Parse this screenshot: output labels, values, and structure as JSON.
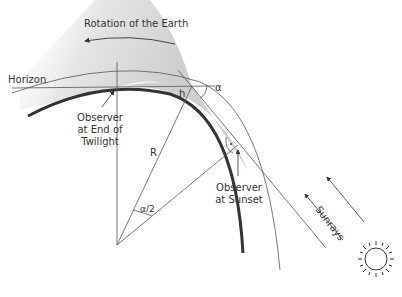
{
  "diagram": {
    "labels": {
      "rotation": "Rotation of the Earth",
      "horizon": "Horizon",
      "h": "h",
      "alpha": "α",
      "R": "R",
      "half_alpha": "α/2",
      "observer_twilight_1": "Observer",
      "observer_twilight_2": "at End of",
      "observer_twilight_3": "Twilight",
      "observer_sunset_1": "Observer",
      "observer_sunset_2": "at Sunset",
      "sunrays": "Sunrays"
    },
    "icons": {
      "sun": "sun-icon"
    },
    "colors": {
      "line": "#444444",
      "earth": "#333333",
      "shadow": "#d4d4d4"
    }
  }
}
